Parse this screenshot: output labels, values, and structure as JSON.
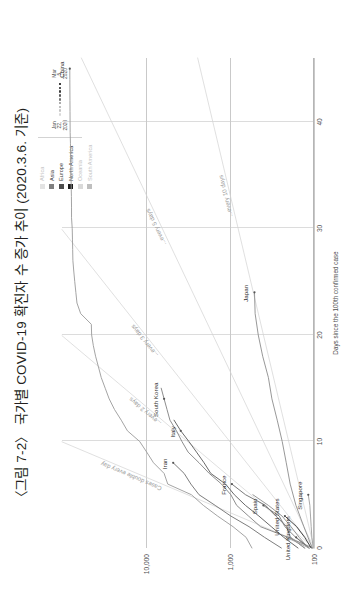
{
  "title": "〈그림 7-2〉 국가별 COVID-19 확진자 수 증가 추이 (2020.3.6. 기준)",
  "legend": {
    "continents": [
      {
        "label": "Africa",
        "color": "#e3e3e3",
        "dim": true
      },
      {
        "label": "Asia",
        "color": "#7f7f7f",
        "dim": false
      },
      {
        "label": "Europe",
        "color": "#4d4d4d",
        "dim": false
      },
      {
        "label": "North America",
        "color": "#1a1a1a",
        "dim": false
      },
      {
        "label": "Oceania",
        "color": "#d9d9d9",
        "dim": true
      },
      {
        "label": "South America",
        "color": "#bfbfbf",
        "dim": true
      }
    ],
    "date_scale": {
      "start_line1": "Jan",
      "start_line2": "22,",
      "start_line3": "2020",
      "end_line1": "Mar",
      "end_line2": "5,",
      "end_line3": "2020",
      "ramp_colors": [
        "#d8d8d8",
        "#c4c4c4",
        "#ababab",
        "#8f8f8f",
        "#737373",
        "#575757",
        "#3b3b3b",
        "#1f1f1f",
        "#000000"
      ]
    }
  },
  "chart_data": {
    "type": "line",
    "title": "국가별 COVID-19 확진자 수 증가 추이",
    "xlabel": "Days since the 100th confirmed case",
    "ylabel": "",
    "xlim": [
      0,
      46
    ],
    "ylim_log": [
      100,
      100000
    ],
    "xticks": [
      0,
      10,
      20,
      30,
      40
    ],
    "xticklabels": [
      "0",
      "10",
      "20",
      "30",
      "40"
    ],
    "yticks": [
      100,
      1000,
      10000
    ],
    "yticklabels": [
      "100",
      "1,000",
      "10,000"
    ],
    "grid": true,
    "yscale": "log",
    "legend_position": "top-right",
    "reference_lines": [
      {
        "label": "Cases double every day",
        "doubling_days": 1
      },
      {
        "label": "... every 2 days",
        "doubling_days": 2
      },
      {
        "label": "... every 3 days",
        "doubling_days": 3
      },
      {
        "label": "... every 5 days",
        "doubling_days": 5
      },
      {
        "label": "... every 10 days",
        "doubling_days": 10
      }
    ],
    "series": [
      {
        "name": "China",
        "continent": "Asia",
        "color": "#9a9a9a",
        "points": [
          [
            0,
            548
          ],
          [
            1,
            643
          ],
          [
            2,
            920
          ],
          [
            3,
            1406
          ],
          [
            4,
            2075
          ],
          [
            5,
            2877
          ],
          [
            6,
            5509
          ],
          [
            7,
            6087
          ],
          [
            8,
            8141
          ],
          [
            9,
            9802
          ],
          [
            10,
            11891
          ],
          [
            11,
            16630
          ],
          [
            12,
            19716
          ],
          [
            13,
            23707
          ],
          [
            14,
            27440
          ],
          [
            15,
            30587
          ],
          [
            16,
            34110
          ],
          [
            17,
            36814
          ],
          [
            18,
            39829
          ],
          [
            19,
            42354
          ],
          [
            20,
            44386
          ],
          [
            21,
            44759
          ],
          [
            22,
            59895
          ],
          [
            23,
            66358
          ],
          [
            24,
            68413
          ],
          [
            25,
            70513
          ],
          [
            26,
            72434
          ],
          [
            27,
            74211
          ],
          [
            28,
            74619
          ],
          [
            29,
            75077
          ],
          [
            30,
            75550
          ],
          [
            31,
            77001
          ],
          [
            32,
            77022
          ],
          [
            33,
            77241
          ],
          [
            34,
            77754
          ],
          [
            35,
            78166
          ],
          [
            36,
            78600
          ],
          [
            37,
            78928
          ],
          [
            38,
            79356
          ],
          [
            39,
            79932
          ],
          [
            40,
            80136
          ],
          [
            41,
            80261
          ],
          [
            42,
            80386
          ],
          [
            43,
            80537
          ],
          [
            44,
            80690
          ],
          [
            45,
            80770
          ]
        ]
      },
      {
        "name": "South Korea",
        "continent": "Asia",
        "color": "#808080",
        "points": [
          [
            0,
            104
          ],
          [
            1,
            204
          ],
          [
            2,
            433
          ],
          [
            3,
            602
          ],
          [
            4,
            833
          ],
          [
            5,
            977
          ],
          [
            6,
            1261
          ],
          [
            7,
            1766
          ],
          [
            8,
            2337
          ],
          [
            9,
            3150
          ],
          [
            10,
            3736
          ],
          [
            11,
            4335
          ],
          [
            12,
            5186
          ],
          [
            13,
            5621
          ],
          [
            14,
            6088
          ],
          [
            15,
            6593
          ]
        ]
      },
      {
        "name": "Italy",
        "continent": "Europe",
        "color": "#585858",
        "points": [
          [
            0,
            155
          ],
          [
            1,
            229
          ],
          [
            2,
            322
          ],
          [
            3,
            453
          ],
          [
            4,
            655
          ],
          [
            5,
            888
          ],
          [
            6,
            1128
          ],
          [
            7,
            1694
          ],
          [
            8,
            2036
          ],
          [
            9,
            2502
          ],
          [
            10,
            3089
          ],
          [
            11,
            3858
          ],
          [
            12,
            4636
          ]
        ]
      },
      {
        "name": "Iran",
        "continent": "Asia",
        "color": "#6e6e6e",
        "points": [
          [
            0,
            245
          ],
          [
            1,
            388
          ],
          [
            2,
            593
          ],
          [
            3,
            978
          ],
          [
            4,
            1501
          ],
          [
            5,
            2336
          ],
          [
            6,
            2922
          ],
          [
            7,
            3513
          ],
          [
            8,
            4747
          ]
        ]
      },
      {
        "name": "France",
        "continent": "Europe",
        "color": "#6a6a6a",
        "points": [
          [
            0,
            130
          ],
          [
            1,
            191
          ],
          [
            2,
            212
          ],
          [
            3,
            285
          ],
          [
            4,
            377
          ],
          [
            5,
            653
          ],
          [
            6,
            949
          ]
        ]
      },
      {
        "name": "Spain",
        "continent": "Europe",
        "color": "#7b7b7b",
        "points": [
          [
            0,
            114
          ],
          [
            1,
            165
          ],
          [
            2,
            222
          ],
          [
            3,
            259
          ],
          [
            4,
            400
          ]
        ]
      },
      {
        "name": "United States",
        "continent": "North America",
        "color": "#2b2b2b",
        "points": [
          [
            0,
            108
          ],
          [
            1,
            129
          ],
          [
            2,
            161
          ],
          [
            3,
            222
          ]
        ]
      },
      {
        "name": "United Kingdom",
        "continent": "Europe",
        "color": "#707070",
        "points": [
          [
            0,
            115
          ],
          [
            1,
            163
          ]
        ]
      },
      {
        "name": "Japan",
        "continent": "Asia",
        "color": "#8c8c8c",
        "points": [
          [
            0,
            105
          ],
          [
            2,
            132
          ],
          [
            4,
            164
          ],
          [
            6,
            192
          ],
          [
            8,
            214
          ],
          [
            10,
            239
          ],
          [
            12,
            274
          ],
          [
            14,
            317
          ],
          [
            16,
            349
          ],
          [
            18,
            408
          ],
          [
            20,
            461
          ],
          [
            22,
            502
          ],
          [
            24,
            511
          ]
        ]
      },
      {
        "name": "Singapore",
        "continent": "Asia",
        "color": "#9e9e9e",
        "points": [
          [
            0,
            102
          ],
          [
            1,
            106
          ],
          [
            2,
            108
          ],
          [
            3,
            110
          ],
          [
            4,
            112
          ],
          [
            5,
            117
          ]
        ]
      },
      {
        "name": "Germany",
        "continent": "Europe",
        "color": "#8a8a8a",
        "points": [
          [
            0,
            117
          ],
          [
            1,
            150
          ],
          [
            2,
            188
          ],
          [
            3,
            240
          ],
          [
            4,
            349
          ],
          [
            5,
            534
          ]
        ]
      },
      {
        "name": "Switzerland",
        "continent": "Europe",
        "color": "#9c9c9c",
        "points": [
          [
            0,
            114
          ],
          [
            1,
            214
          ]
        ]
      },
      {
        "name": "Netherlands",
        "continent": "Europe",
        "color": "#a5a5a5",
        "points": [
          [
            0,
            128
          ],
          [
            1,
            188
          ]
        ]
      }
    ],
    "point_labels": [
      {
        "text": "China",
        "x": 45,
        "y": 80770
      },
      {
        "text": "South Korea",
        "x": 14,
        "y": 6088
      },
      {
        "text": "Italy",
        "x": 11,
        "y": 3858
      },
      {
        "text": "Iran",
        "x": 8,
        "y": 4747
      },
      {
        "text": "Japan",
        "x": 24,
        "y": 511
      },
      {
        "text": "France",
        "x": 6,
        "y": 949
      },
      {
        "text": "Spain",
        "x": 4,
        "y": 400
      },
      {
        "text": "United States",
        "x": 3,
        "y": 222
      },
      {
        "text": "United Kingdom",
        "x": 1,
        "y": 163
      },
      {
        "text": "Singapore",
        "x": 5,
        "y": 117
      }
    ]
  },
  "annotations": {
    "double_every_day": "Cases double every day",
    "every_2_days": "...every 2 days",
    "every_3_days": "...every 3 days",
    "every_5_days": "...every 5 days",
    "every_10_days": "...every 10 days"
  }
}
